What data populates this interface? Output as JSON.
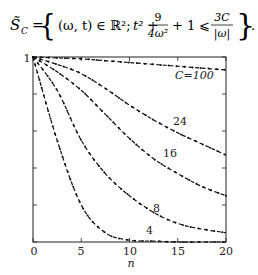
{
  "formula": {
    "lhs": "S̃",
    "lhs_sub": "C",
    "eq": "=",
    "set_open": "{",
    "tuple": "(ω, t) ∈ ℝ²;",
    "t_term": "t² +",
    "frac1_num": "9",
    "frac1_den": "4ω²",
    "mid": "+ 1 ⩽",
    "frac2_num": "3C",
    "frac2_den": "|ω|",
    "set_close": "}",
    "trail": "."
  },
  "chart_data": {
    "type": "line",
    "title": "",
    "xlabel": "n",
    "ylabel": "",
    "xlim": [
      0,
      20
    ],
    "ylim": [
      0,
      1
    ],
    "x_ticks": [
      0,
      5,
      10,
      15,
      20
    ],
    "y_tick_labels": [
      "1"
    ],
    "y_ticks": [
      0,
      0.2,
      0.4,
      0.6,
      0.8,
      1
    ],
    "grid": false,
    "legend": "inline labels",
    "line_style": "dashed with dot markers",
    "x": [
      0,
      2.5,
      5,
      7.5,
      10,
      12.5,
      15,
      17.5,
      20
    ],
    "series": [
      {
        "name": "C=100",
        "label": "C=100",
        "values": [
          1.0,
          0.995,
          0.99,
          0.98,
          0.97,
          0.96,
          0.95,
          0.94,
          0.93
        ]
      },
      {
        "name": "24",
        "label": "24",
        "values": [
          1.0,
          0.96,
          0.91,
          0.83,
          0.74,
          0.66,
          0.59,
          0.53,
          0.47
        ]
      },
      {
        "name": "16",
        "label": "16",
        "values": [
          1.0,
          0.92,
          0.82,
          0.69,
          0.56,
          0.45,
          0.37,
          0.3,
          0.25
        ]
      },
      {
        "name": "8",
        "label": "8",
        "values": [
          1.0,
          0.82,
          0.55,
          0.37,
          0.25,
          0.16,
          0.1,
          0.07,
          0.05
        ]
      },
      {
        "name": "4",
        "label": "4",
        "values": [
          1.0,
          0.55,
          0.2,
          0.05,
          0.01,
          0.005,
          0.0,
          0.0,
          0.0
        ]
      }
    ],
    "annotations": [
      "C=100",
      "24",
      "16",
      "8",
      "4"
    ]
  },
  "labels": {
    "y_top": "1",
    "x0": "0",
    "x5": "5",
    "x10": "10",
    "x15": "15",
    "x20": "20",
    "xlabel": "n",
    "c100": "C=100",
    "c24": "24",
    "c16": "16",
    "c8": "8",
    "c4": "4"
  }
}
